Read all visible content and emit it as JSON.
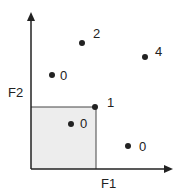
{
  "axes": {
    "x_label": "F1",
    "y_label": "F2"
  },
  "colors": {
    "ink": "#222222",
    "shade": "#ededed",
    "background": "#ffffff"
  },
  "region": {
    "x0": 31,
    "y0": 107,
    "x1": 96,
    "y1": 169
  },
  "points": [
    {
      "x": 82,
      "y": 43,
      "label": "2"
    },
    {
      "x": 145,
      "y": 57,
      "label": "4"
    },
    {
      "x": 52,
      "y": 75,
      "label": "0"
    },
    {
      "x": 95,
      "y": 107,
      "label": "1"
    },
    {
      "x": 71,
      "y": 124,
      "label": "0"
    },
    {
      "x": 128,
      "y": 146,
      "label": "0"
    }
  ]
}
